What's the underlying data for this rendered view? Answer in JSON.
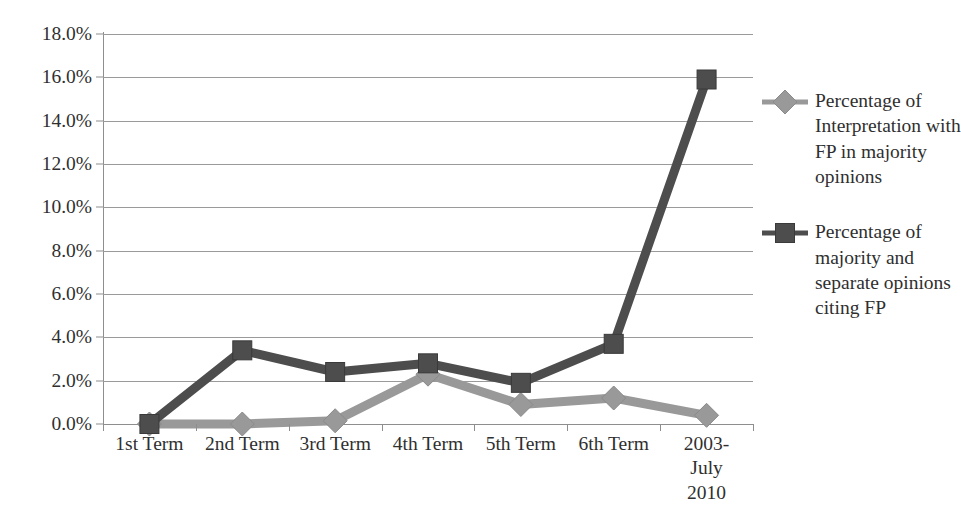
{
  "chart_data": {
    "type": "line",
    "title": "",
    "xlabel": "",
    "ylabel": "",
    "grid": true,
    "legend_position": "right",
    "ylim": [
      0,
      18
    ],
    "ytick_step": 2,
    "ytick_labels": [
      "18.0%",
      "16.0%",
      "14.0%",
      "12.0%",
      "10.0%",
      "8.0%",
      "6.0%",
      "4.0%",
      "2.0%",
      "0.0%"
    ],
    "ytick_values": [
      18,
      16,
      14,
      12,
      10,
      8,
      6,
      4,
      2,
      0
    ],
    "categories": [
      "1st Term",
      "2nd Term",
      "3rd Term",
      "4th Term",
      "5th Term",
      "6th Term",
      "2003-July\n2010"
    ],
    "series": [
      {
        "name": "Percentage of Interpretation with FP in majority opinions",
        "color": "#999999",
        "marker": "diamond",
        "values": [
          0.0,
          0.0,
          0.15,
          2.3,
          0.9,
          1.2,
          0.4
        ]
      },
      {
        "name": "Percentage of majority and separate opinions citing FP",
        "color": "#4d4d4d",
        "marker": "square",
        "values": [
          0.0,
          3.4,
          2.4,
          2.8,
          1.9,
          3.7,
          15.9
        ]
      }
    ]
  },
  "legend": {
    "entries": [
      {
        "label": "Percentage of Interpretation with FP in majority opinions",
        "color": "#999999",
        "marker": "diamond"
      },
      {
        "label": "Percentage of majority and separate opinions citing FP",
        "color": "#4d4d4d",
        "marker": "square"
      }
    ]
  },
  "colors": {
    "series_light": "#999999",
    "series_dark": "#4d4d4d",
    "gridline": "#9a9a9a",
    "axis": "#8e8e8e",
    "text": "#2f2f2f",
    "background": "#ffffff"
  }
}
